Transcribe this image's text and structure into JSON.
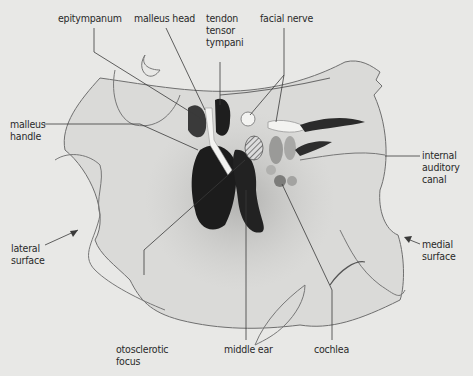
{
  "diagram": {
    "title": "",
    "background": "#e8e8e6",
    "labels": {
      "epitympanum": "epitympanum",
      "malleus_head": "malleus head",
      "tendon_tensor_tympani": [
        "tendon",
        "tensor",
        "tympani"
      ],
      "facial_nerve": "facial nerve",
      "malleus_handle": [
        "malleus",
        "handle"
      ],
      "internal_auditory_canal": [
        "internal",
        "auditory",
        "canal"
      ],
      "lateral_surface": [
        "lateral",
        "surface"
      ],
      "medial_surface": [
        "medial",
        "surface"
      ],
      "otosclerotic_focus": [
        "otosclerotic",
        "focus"
      ],
      "middle_ear": "middle ear",
      "cochlea": "cochlea"
    },
    "colors": {
      "dark_structure": "#1c1c1c",
      "bone": "#d9d9d7",
      "line": "#3a3a3a"
    }
  }
}
